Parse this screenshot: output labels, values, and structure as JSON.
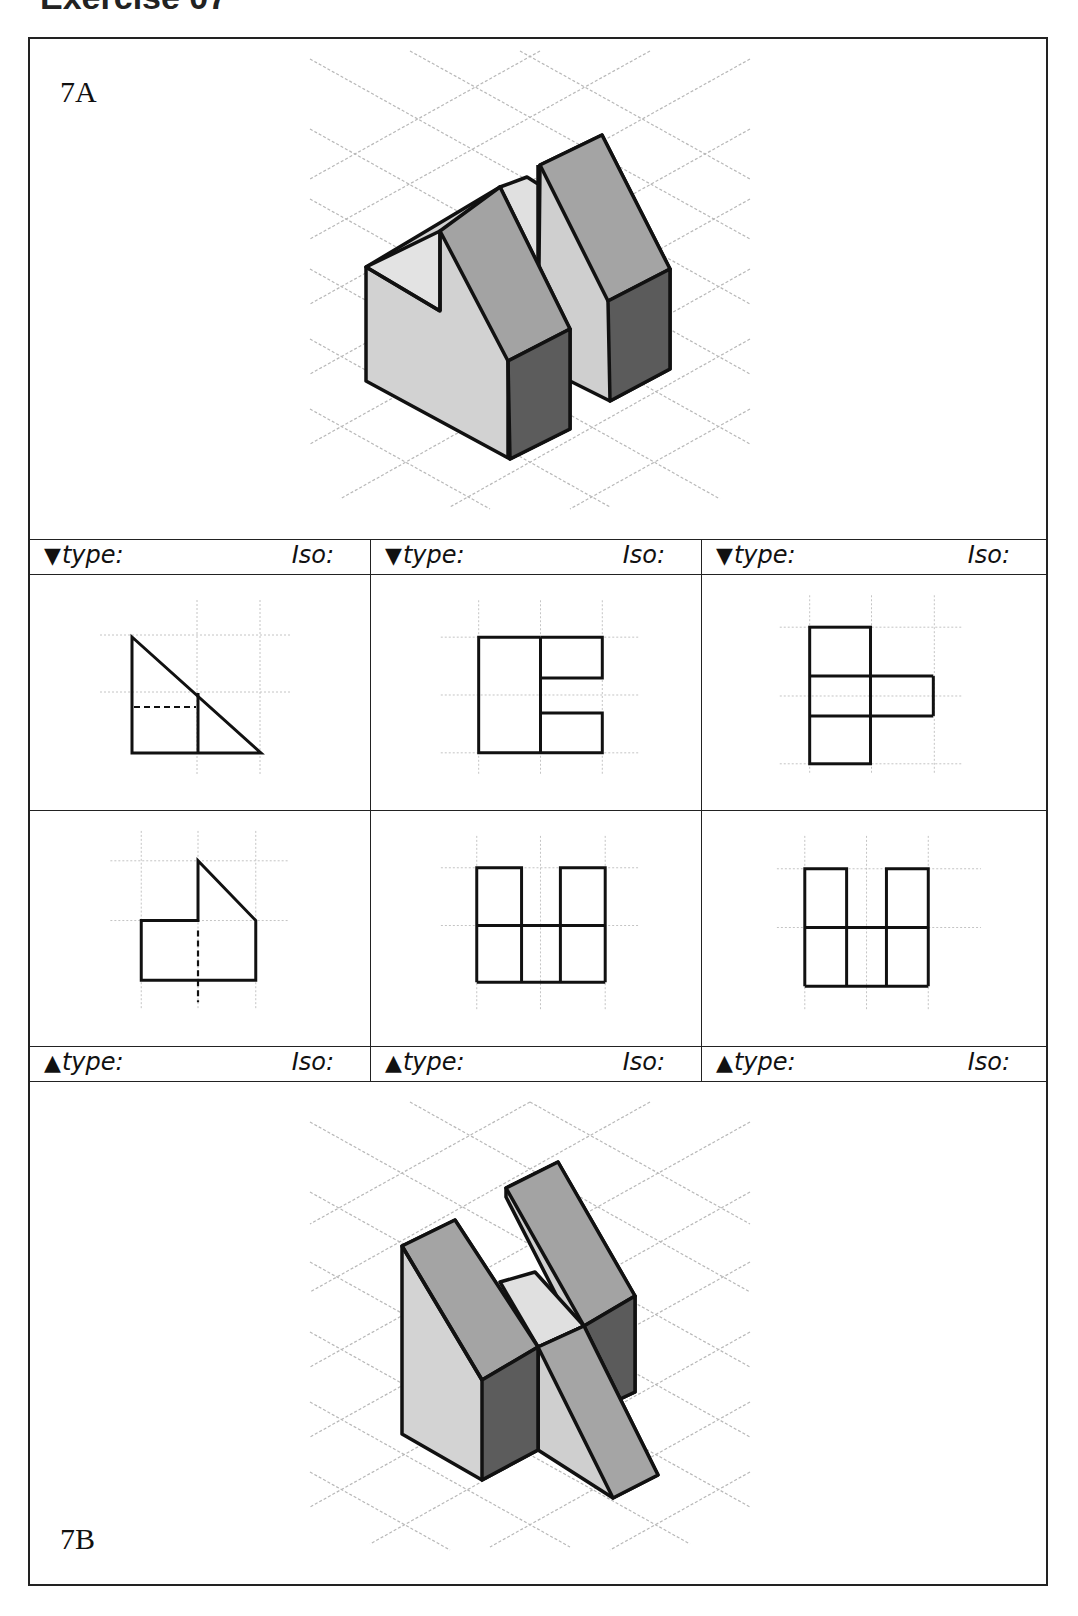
{
  "page": {
    "title_cut_off": "Exercise 07",
    "colors": {
      "border": "#222222",
      "grid": "#bdbdbd",
      "face_light": "#d4d4d4",
      "face_mid": "#a6a6a6",
      "face_dark": "#5e5e5e",
      "face_top_light": "#e2e2e2"
    }
  },
  "panels": {
    "top": {
      "label": "7A",
      "content": "isometric-drawing-7A"
    },
    "bottom": {
      "label": "7B",
      "content": "isometric-drawing-7B"
    }
  },
  "header_rows": {
    "top": {
      "arrow": "▼",
      "cells": [
        {
          "type_label": "type:",
          "iso_label": "Iso:"
        },
        {
          "type_label": "type:",
          "iso_label": "Iso:"
        },
        {
          "type_label": "type:",
          "iso_label": "Iso:"
        }
      ]
    },
    "bottom": {
      "arrow": "▲",
      "cells": [
        {
          "type_label": "type:",
          "iso_label": "Iso:"
        },
        {
          "type_label": "type:",
          "iso_label": "Iso:"
        },
        {
          "type_label": "type:",
          "iso_label": "Iso:"
        }
      ]
    }
  },
  "orthographic_views": [
    {
      "row": 1,
      "col": 1,
      "name": "right-triangle-with-hidden-line"
    },
    {
      "row": 1,
      "col": 2,
      "name": "notched-e-shape"
    },
    {
      "row": 1,
      "col": 3,
      "name": "cross-t-shape"
    },
    {
      "row": 2,
      "col": 1,
      "name": "stepped-profile-with-hidden-line"
    },
    {
      "row": 2,
      "col": 2,
      "name": "double-post-u-shape-wide"
    },
    {
      "row": 2,
      "col": 3,
      "name": "double-post-u-shape-narrow"
    }
  ]
}
